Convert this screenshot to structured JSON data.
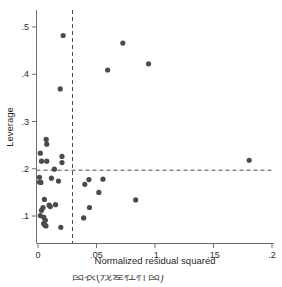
{
  "figure": {
    "caption_partial": "图表(残差杠杆图)"
  },
  "chart_data": {
    "type": "scatter",
    "title": "",
    "xlabel": "Normalized residual squared",
    "ylabel": "Leverage",
    "xlim": [
      0,
      0.2
    ],
    "ylim": [
      0.07,
      0.515
    ],
    "grid": false,
    "legend": "none",
    "xticks": [
      0,
      0.05,
      0.1,
      0.15,
      0.2
    ],
    "xtick_labels": [
      "0",
      ".05",
      ".1",
      ".15",
      ".2"
    ],
    "yticks": [
      0.1,
      0.2,
      0.3,
      0.4,
      0.5
    ],
    "ytick_labels": [
      ".1",
      ".2",
      ".3",
      ".4",
      ".5"
    ],
    "reference_lines": [
      {
        "orientation": "horizontal",
        "value": 0.197,
        "style": "dashed"
      },
      {
        "orientation": "vertical",
        "value": 0.0295,
        "style": "dashed"
      }
    ],
    "marker": {
      "shape": "circle",
      "color": "#4b4b4b",
      "size": 2.6
    },
    "points": [
      {
        "x": 0.0215,
        "y": 0.482
      },
      {
        "x": 0.0725,
        "y": 0.466
      },
      {
        "x": 0.0945,
        "y": 0.422
      },
      {
        "x": 0.0595,
        "y": 0.409
      },
      {
        "x": 0.019,
        "y": 0.369
      },
      {
        "x": 0.007,
        "y": 0.262
      },
      {
        "x": 0.0075,
        "y": 0.252
      },
      {
        "x": 0.002,
        "y": 0.233
      },
      {
        "x": 0.0205,
        "y": 0.226
      },
      {
        "x": 0.1805,
        "y": 0.218
      },
      {
        "x": 0.003,
        "y": 0.216
      },
      {
        "x": 0.0075,
        "y": 0.216
      },
      {
        "x": 0.0205,
        "y": 0.213
      },
      {
        "x": 0.014,
        "y": 0.199
      },
      {
        "x": 0.0013,
        "y": 0.182
      },
      {
        "x": 0.0115,
        "y": 0.18
      },
      {
        "x": 0.0435,
        "y": 0.177
      },
      {
        "x": 0.0555,
        "y": 0.178
      },
      {
        "x": 0.0013,
        "y": 0.172
      },
      {
        "x": 0.0025,
        "y": 0.171
      },
      {
        "x": 0.0175,
        "y": 0.174
      },
      {
        "x": 0.04,
        "y": 0.167
      },
      {
        "x": 0.052,
        "y": 0.15
      },
      {
        "x": 0.0835,
        "y": 0.134
      },
      {
        "x": 0.0055,
        "y": 0.135
      },
      {
        "x": 0.0095,
        "y": 0.123
      },
      {
        "x": 0.015,
        "y": 0.124
      },
      {
        "x": 0.0105,
        "y": 0.12
      },
      {
        "x": 0.0043,
        "y": 0.118
      },
      {
        "x": 0.044,
        "y": 0.118
      },
      {
        "x": 0.003,
        "y": 0.112
      },
      {
        "x": 0.002,
        "y": 0.101
      },
      {
        "x": 0.005,
        "y": 0.097
      },
      {
        "x": 0.039,
        "y": 0.096
      },
      {
        "x": 0.0063,
        "y": 0.091
      },
      {
        "x": 0.0048,
        "y": 0.084
      },
      {
        "x": 0.0058,
        "y": 0.081
      },
      {
        "x": 0.0068,
        "y": 0.079
      },
      {
        "x": 0.0195,
        "y": 0.076
      }
    ]
  }
}
